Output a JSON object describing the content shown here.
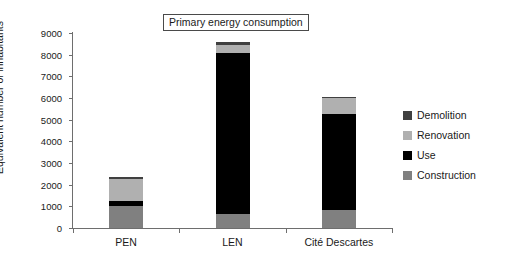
{
  "chart_data": {
    "type": "bar",
    "title": "Primary energy consumption",
    "xlabel": "",
    "ylabel": "Equivalent number of inhabitants",
    "stacked": true,
    "grid": false,
    "legend_position": "right",
    "ylim": [
      0,
      9000
    ],
    "yticks": [
      0,
      1000,
      2000,
      3000,
      4000,
      5000,
      6000,
      7000,
      8000,
      9000
    ],
    "ytick_labels": [
      "0",
      "1000",
      "2000",
      "3000",
      "4000",
      "5000",
      "6000",
      "7000",
      "8000",
      "9000"
    ],
    "categories": [
      "PEN",
      "LEN",
      "Cité Descartes"
    ],
    "series": [
      {
        "name": "Construction",
        "color": "#808080",
        "values": [
          1000,
          650,
          850
        ]
      },
      {
        "name": "Use",
        "color": "#000000",
        "values": [
          270,
          7450,
          4400
        ]
      },
      {
        "name": "Renovation",
        "color": "#b0b0b0",
        "values": [
          1000,
          350,
          750
        ]
      },
      {
        "name": "Demolition",
        "color": "#404040",
        "values": [
          80,
          150,
          50
        ]
      }
    ],
    "totals": [
      2350,
      8600,
      6050
    ],
    "legend_order": [
      "Demolition",
      "Renovation",
      "Use",
      "Construction"
    ]
  },
  "legend": {
    "items": [
      {
        "label": "Demolition",
        "color": "#404040"
      },
      {
        "label": "Renovation",
        "color": "#b0b0b0"
      },
      {
        "label": "Use",
        "color": "#000000"
      },
      {
        "label": "Construction",
        "color": "#808080"
      }
    ]
  },
  "axes": {
    "y_title": "Equivalent number of inhabitants"
  }
}
